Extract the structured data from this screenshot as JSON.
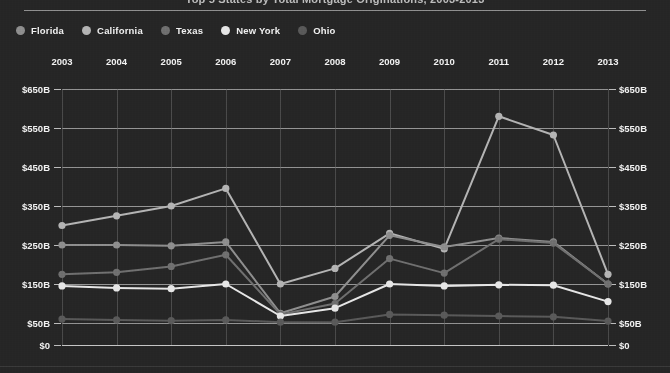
{
  "header": {
    "title": "Top 5 States by Total Mortgage Originations, 2003-2013"
  },
  "legend": {
    "items": [
      {
        "label": "Florida",
        "color": "#8f8f8f"
      },
      {
        "label": "California",
        "color": "#b4b4b4"
      },
      {
        "label": "Texas",
        "color": "#707070"
      },
      {
        "label": "New York",
        "color": "#e6e6e6"
      },
      {
        "label": "Ohio",
        "color": "#5a5a5a"
      }
    ]
  },
  "axis": {
    "y_ticks": [
      "$650B",
      "$550B",
      "$450B",
      "$350B",
      "$250B",
      "$150B",
      "$50B",
      "$0"
    ],
    "x_ticks": [
      "2003",
      "2004",
      "2005",
      "2006",
      "2007",
      "2008",
      "2009",
      "2010",
      "2011",
      "2012",
      "2013"
    ]
  },
  "chart_data": {
    "type": "line",
    "title": "Top 5 States by Total Mortgage Originations, 2003-2013",
    "xlabel": "",
    "ylabel": "",
    "ylim": [
      0,
      650
    ],
    "yticks": [
      0,
      50,
      150,
      250,
      350,
      450,
      550,
      650
    ],
    "ytick_labels": [
      "$0",
      "$50B",
      "$150B",
      "$250B",
      "$350B",
      "$450B",
      "$550B",
      "$650B"
    ],
    "grid": true,
    "legend_position": "top-left",
    "categories": [
      "2003",
      "2004",
      "2005",
      "2006",
      "2007",
      "2008",
      "2009",
      "2010",
      "2011",
      "2012",
      "2013"
    ],
    "series": [
      {
        "name": "California",
        "color": "#b4b4b4",
        "values": [
          300,
          325,
          350,
          395,
          150,
          190,
          280,
          240,
          580,
          532,
          175
        ]
      },
      {
        "name": "Florida",
        "color": "#8f8f8f",
        "values": [
          250,
          250,
          248,
          258,
          75,
          118,
          275,
          245,
          268,
          258,
          150
        ]
      },
      {
        "name": "Texas",
        "color": "#707070",
        "values": [
          175,
          180,
          195,
          225,
          72,
          100,
          215,
          178,
          265,
          255,
          150
        ]
      },
      {
        "name": "New York",
        "color": "#e6e6e6",
        "values": [
          145,
          140,
          138,
          150,
          68,
          88,
          150,
          145,
          148,
          147,
          105
        ]
      },
      {
        "name": "Ohio",
        "color": "#5a5a5a",
        "values": [
          60,
          58,
          56,
          58,
          52,
          52,
          72,
          70,
          68,
          66,
          55
        ]
      }
    ]
  }
}
